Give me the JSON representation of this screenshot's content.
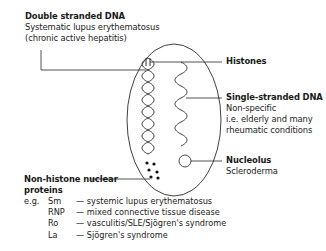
{
  "labels": {
    "dsdna": {
      "title": "Double stranded DNA",
      "lines": [
        "Systematic lupus erythematosus",
        "(chronic active hepatitis)"
      ]
    },
    "histones": {
      "title": "Histones"
    },
    "ssdna": {
      "title": "Single-stranded DNA",
      "lines": [
        "Non-specific",
        "i.e. elderly and many",
        "rheumatic conditions"
      ]
    },
    "nucleolus": {
      "title": "Nucleolus",
      "lines": [
        "Scleroderma"
      ]
    },
    "nonhistone": {
      "title_line1": "Non-histone nuclear",
      "title_line2": "proteins",
      "examples_prefix": "e.g.",
      "examples": [
        {
          "antigen": "Sm",
          "disease": "— systemic lupus erythematosus"
        },
        {
          "antigen": "RNP",
          "disease": "— mixed connective tissue disease"
        },
        {
          "antigen": "Ro",
          "disease": "— vasculitis/SLE/Sjögren's syndrome"
        },
        {
          "antigen": "La",
          "disease": "— Sjögren's syndrome"
        }
      ]
    }
  },
  "colors": {
    "line": "#2a2a2a",
    "text": "#1a1a1a"
  }
}
